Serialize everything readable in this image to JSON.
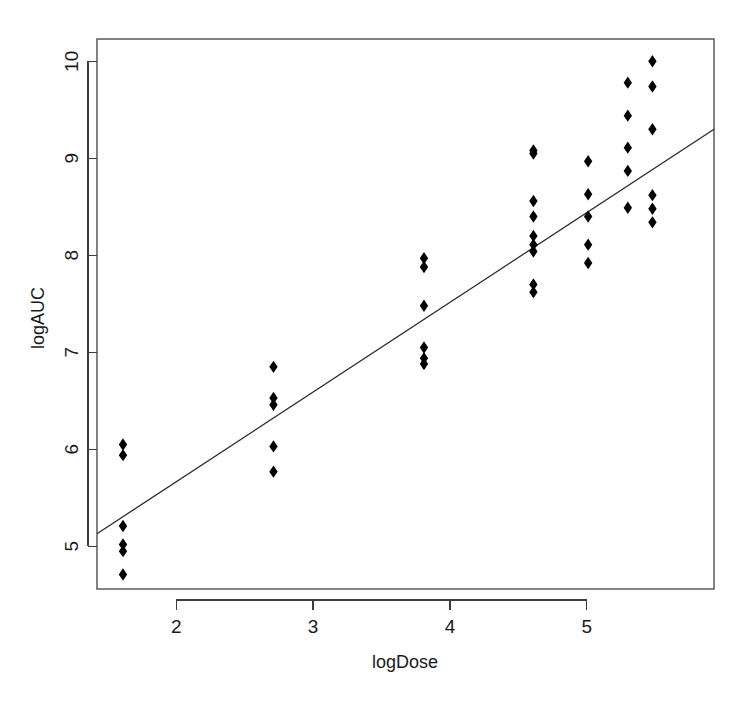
{
  "chart_data": {
    "type": "scatter",
    "title": "",
    "xlabel": "logDose",
    "ylabel": "logAUC",
    "xlim": [
      1.42,
      5.93
    ],
    "ylim": [
      4.56,
      10.23
    ],
    "xticks": [
      2,
      3,
      4,
      5
    ],
    "yticks": [
      5,
      6,
      7,
      8,
      9,
      10
    ],
    "xtick_labels": [
      "2",
      "3",
      "4",
      "5"
    ],
    "ytick_labels": [
      "5",
      "6",
      "7",
      "8",
      "9",
      "10"
    ],
    "grid": false,
    "legend": null,
    "marker": "filled-diamond",
    "point_color": "#000000",
    "line_color": "#2b2b2b",
    "frame_color": "#5a5a5a",
    "background": "#ffffff",
    "points": [
      {
        "x": 1.61,
        "y": 6.05
      },
      {
        "x": 1.61,
        "y": 5.94
      },
      {
        "x": 1.61,
        "y": 5.21
      },
      {
        "x": 1.61,
        "y": 5.02
      },
      {
        "x": 1.61,
        "y": 4.95
      },
      {
        "x": 1.61,
        "y": 4.71
      },
      {
        "x": 2.71,
        "y": 6.85
      },
      {
        "x": 2.71,
        "y": 6.53
      },
      {
        "x": 2.71,
        "y": 6.46
      },
      {
        "x": 2.71,
        "y": 6.03
      },
      {
        "x": 2.71,
        "y": 5.77
      },
      {
        "x": 3.81,
        "y": 7.97
      },
      {
        "x": 3.81,
        "y": 7.88
      },
      {
        "x": 3.81,
        "y": 7.48
      },
      {
        "x": 3.81,
        "y": 7.05
      },
      {
        "x": 3.81,
        "y": 6.94
      },
      {
        "x": 3.81,
        "y": 6.88
      },
      {
        "x": 4.61,
        "y": 9.08
      },
      {
        "x": 4.61,
        "y": 9.05
      },
      {
        "x": 4.61,
        "y": 8.56
      },
      {
        "x": 4.61,
        "y": 8.4
      },
      {
        "x": 4.61,
        "y": 8.2
      },
      {
        "x": 4.61,
        "y": 8.11
      },
      {
        "x": 4.61,
        "y": 8.04
      },
      {
        "x": 4.61,
        "y": 7.7
      },
      {
        "x": 4.61,
        "y": 7.62
      },
      {
        "x": 5.01,
        "y": 8.97
      },
      {
        "x": 5.01,
        "y": 8.63
      },
      {
        "x": 5.01,
        "y": 8.4
      },
      {
        "x": 5.01,
        "y": 8.11
      },
      {
        "x": 5.01,
        "y": 7.92
      },
      {
        "x": 5.3,
        "y": 9.78
      },
      {
        "x": 5.3,
        "y": 9.44
      },
      {
        "x": 5.3,
        "y": 9.11
      },
      {
        "x": 5.3,
        "y": 8.87
      },
      {
        "x": 5.3,
        "y": 8.49
      },
      {
        "x": 5.48,
        "y": 10.0
      },
      {
        "x": 5.48,
        "y": 9.74
      },
      {
        "x": 5.48,
        "y": 9.3
      },
      {
        "x": 5.48,
        "y": 8.62
      },
      {
        "x": 5.48,
        "y": 8.48
      },
      {
        "x": 5.48,
        "y": 8.34
      }
    ],
    "fit_line": {
      "x1": 1.42,
      "y1": 5.13,
      "x2": 5.93,
      "y2": 9.3
    }
  }
}
